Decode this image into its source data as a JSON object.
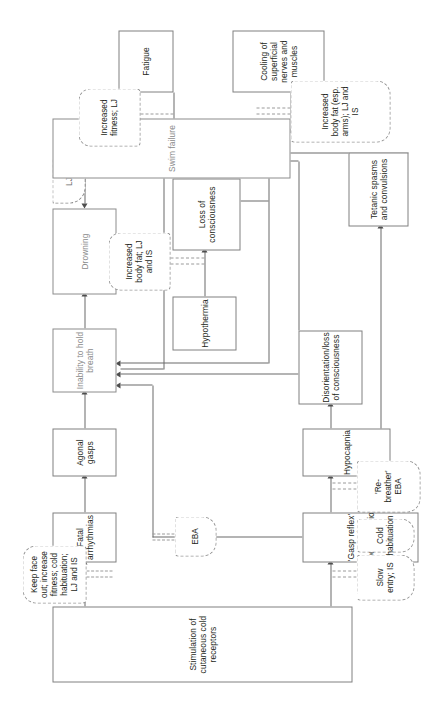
{
  "diagram": {
    "orientation": "rotated-90-ccw",
    "colors": {
      "box_stroke": "#808080",
      "outcome_text": "#8a8a8a",
      "annotation_stroke": "#9a9a9a",
      "line": "#6b6b6b",
      "text": "#231f20",
      "background": "#ffffff"
    },
    "nodes": [
      {
        "id": "stimulation",
        "label": "Stimulation of cutaneous cold receptors",
        "style": "solid"
      },
      {
        "id": "fatal_arr",
        "label": "Fatal arrhythmias",
        "style": "solid"
      },
      {
        "id": "agonal",
        "label": "Agonal gasps",
        "style": "solid"
      },
      {
        "id": "gasp_reflex",
        "label": "'Gasp reflex' and hyperventilation",
        "style": "solid"
      },
      {
        "id": "hypocapnia",
        "label": "Hypocapnia",
        "style": "solid"
      },
      {
        "id": "disorientation",
        "label": "Disorientation/loss of consciousness",
        "style": "solid"
      },
      {
        "id": "tetanic",
        "label": "Tetanic spasms and convulsions",
        "style": "solid"
      },
      {
        "id": "hypothermia",
        "label": "Hypothermia",
        "style": "solid"
      },
      {
        "id": "loss_consc",
        "label": "Loss of consciousness",
        "style": "solid"
      },
      {
        "id": "inability",
        "label": "Inability to hold breath",
        "style": "solid-gray"
      },
      {
        "id": "drowning",
        "label": "Drowning",
        "style": "solid-gray"
      },
      {
        "id": "swim_failure",
        "label": "Swim failure",
        "style": "solid-gray"
      },
      {
        "id": "lj_small",
        "label": "LJ",
        "style": "dashed"
      },
      {
        "id": "fatigue",
        "label": "Fatigue",
        "style": "solid"
      },
      {
        "id": "cooling",
        "label": "Cooling of superficial nerves and muscles",
        "style": "solid"
      }
    ],
    "annotations": [
      {
        "id": "ann_slow_entry",
        "label": "Slow entry; IS"
      },
      {
        "id": "ann_cold_hab",
        "label": "Cold habituation"
      },
      {
        "id": "ann_rebreather",
        "label": "'Re-breather' EBA"
      },
      {
        "id": "ann_eba",
        "label": "EBA"
      },
      {
        "id": "ann_keep_face",
        "label": "Keep face out; increase fitness; cold habituation; LJ and IS"
      },
      {
        "id": "ann_body_fat",
        "label": "Increased body fat; LJ and IS"
      },
      {
        "id": "ann_fitness",
        "label": "Increased fitness; LJ"
      },
      {
        "id": "ann_body_fat_arms",
        "label": "Increased body fat (esp. arms); LJ and IS"
      }
    ]
  }
}
